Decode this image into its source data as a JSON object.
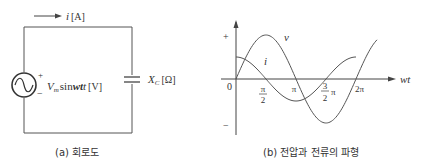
{
  "circuit": {
    "current_label": "i",
    "current_unit": "[A]",
    "source_plus": "+",
    "source_minus": "−",
    "source_V": "V",
    "source_sub": "m",
    "source_expr": "sin",
    "source_wt": "wt",
    "source_unit": "[V]",
    "cap_X": "X",
    "cap_sub": "C",
    "cap_unit": "[Ω]",
    "caption": "(a) 회로도"
  },
  "waveform": {
    "y_plus": "+",
    "y_minus": "−",
    "origin": "0",
    "x_axis_label": "wt",
    "tick_pi2_num": "π",
    "tick_pi2_den": "2",
    "tick_pi": "π",
    "tick_3pi2_num": "3",
    "tick_3pi2_den": "2",
    "tick_3pi2_pi": "π",
    "tick_2pi": "2π",
    "v_label": "v",
    "i_label": "i",
    "caption": "(b) 전압과 전류의 파형"
  },
  "chart_data": {
    "type": "line",
    "title": "(b) 전압과 전류의 파형",
    "xlabel": "wt",
    "ylabel": "",
    "x_ticks": [
      "0",
      "π/2",
      "π",
      "3/2π",
      "2π"
    ],
    "xlim": [
      0,
      6.2832
    ],
    "ylim": [
      -1,
      1
    ],
    "series": [
      {
        "name": "v",
        "function": "sin(wt)",
        "amplitude": 1.0
      },
      {
        "name": "i",
        "function": "cos(wt)",
        "amplitude": 0.5
      }
    ],
    "grid": false
  }
}
